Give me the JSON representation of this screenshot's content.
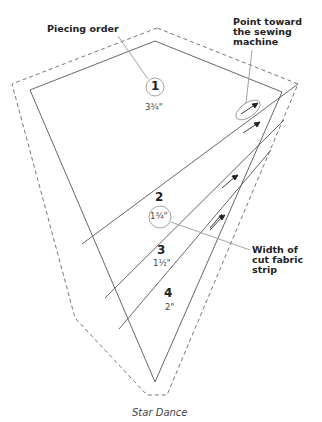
{
  "caption": "Star Dance",
  "callouts": {
    "piecing_order": "Piecing order",
    "point_toward": [
      "Point toward",
      "the sewing",
      "machine"
    ],
    "width_of_strip": [
      "Width of",
      "cut fabric",
      "strip"
    ]
  },
  "pieces": [
    {
      "number": "1",
      "width": "3¾\""
    },
    {
      "number": "2",
      "width": "1¾\""
    },
    {
      "number": "3",
      "width": "1½\""
    },
    {
      "number": "4",
      "width": "2\""
    }
  ],
  "colors": {
    "line": "#555555",
    "dashed": "#555555",
    "leader": "#999999",
    "text": "#222222"
  }
}
